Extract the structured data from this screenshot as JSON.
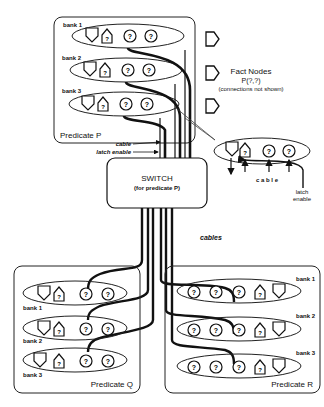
{
  "predicate_p": {
    "title": "Predicate P",
    "banks": [
      "bank 1",
      "bank 2",
      "bank 3"
    ]
  },
  "predicate_q": {
    "title": "Predicate Q",
    "banks": [
      "bank 1",
      "bank 2",
      "bank 3"
    ]
  },
  "predicate_r": {
    "title": "Predicate R",
    "banks": [
      "bank 1",
      "bank 2",
      "bank 3"
    ]
  },
  "fact_nodes": {
    "title": "Fact Nodes",
    "pattern": "P(?,?)",
    "note": "(connections not shown)"
  },
  "switch": {
    "title": "SWITCH",
    "subtitle": "(for predicate P)"
  },
  "labels": {
    "cable": "cable",
    "latch_enable": "latch enable",
    "cables": "cables",
    "detail_cable": "c a b l e",
    "detail_latch": "latch",
    "detail_enable": "enable"
  },
  "node_glyph": "?"
}
